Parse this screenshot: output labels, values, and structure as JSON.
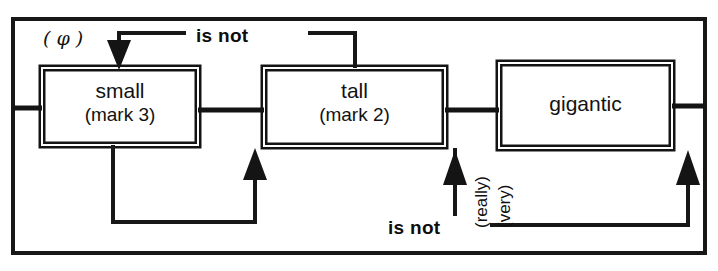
{
  "figure": {
    "kind": "transition-network-diagram",
    "ink_color": "#111111",
    "background_color": "#ffffff"
  },
  "nodes": [
    {
      "id": "small",
      "main": "small",
      "sub": "(mark 3)"
    },
    {
      "id": "tall",
      "main": "tall",
      "sub": "(mark 2)"
    },
    {
      "id": "gigantic",
      "main": "gigantic",
      "sub": ""
    }
  ],
  "arcs": [
    {
      "id": "top-loop",
      "label": "is not",
      "from": "tall",
      "to": "small",
      "direction": "right-to-left"
    },
    {
      "id": "bottom-loop",
      "label": "is not",
      "from": "gigantic",
      "to": "tall",
      "direction": "right-to-left"
    }
  ],
  "annotations": {
    "empty_symbol": "( φ )",
    "intensifier_really": "(really)",
    "intensifier_very": "(very)"
  }
}
